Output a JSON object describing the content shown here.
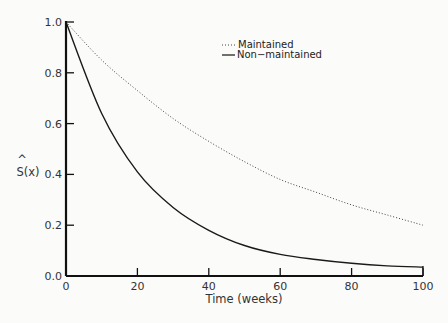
{
  "chart_data": {
    "type": "line",
    "title": "",
    "xlabel": "Time (weeks)",
    "ylabel": "Ŝ(x)",
    "ylabel_hat": "^",
    "ylabel_main": "S(x)",
    "xlim": [
      0,
      100
    ],
    "ylim": [
      0,
      1.0
    ],
    "x_ticks": [
      "0",
      "20",
      "40",
      "60",
      "80",
      "100"
    ],
    "y_ticks": [
      "0.0",
      "0.2",
      "0.4",
      "0.6",
      "0.8",
      "1.0"
    ],
    "grid": false,
    "legend_position": "upper right",
    "x": [
      0,
      10,
      20,
      30,
      40,
      50,
      60,
      70,
      80,
      90,
      100
    ],
    "series": [
      {
        "name": "Maintained",
        "style": "dotted",
        "values": [
          1.0,
          0.85,
          0.73,
          0.62,
          0.53,
          0.45,
          0.38,
          0.33,
          0.28,
          0.24,
          0.2
        ]
      },
      {
        "name": "Non-maintained",
        "style": "solid",
        "values": [
          1.0,
          0.64,
          0.41,
          0.27,
          0.18,
          0.12,
          0.085,
          0.065,
          0.05,
          0.04,
          0.035
        ]
      }
    ]
  },
  "legend": {
    "items": [
      {
        "label": "Maintained",
        "style": "dotted"
      },
      {
        "label": "Non−maintained",
        "style": "solid"
      }
    ]
  }
}
